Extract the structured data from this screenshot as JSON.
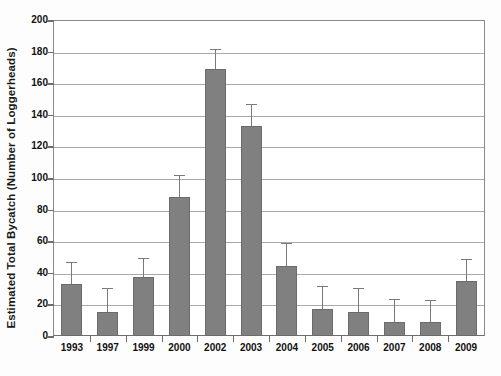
{
  "chart_data": {
    "type": "bar",
    "title": "",
    "xlabel": "",
    "ylabel": "Estimated Total Bycatch (Number of Loggerheads)",
    "ylim": [
      0,
      200
    ],
    "ytick_step": 20,
    "yticks": [
      0,
      20,
      40,
      60,
      80,
      100,
      120,
      140,
      160,
      180,
      200
    ],
    "ytick_labels": [
      "0",
      "20",
      "40",
      "60",
      "80",
      "100",
      "120",
      "140",
      "160",
      "180",
      "200"
    ],
    "grid": true,
    "grid_axis": "y",
    "legend": false,
    "legend_position": "none",
    "bar_color": "#808080",
    "bar_edge_color": "#6b6b6b",
    "error_bar_color": "#7a7a7a",
    "error_bar_style": "upper-only",
    "categories": [
      "1993",
      "1997",
      "1999",
      "2000",
      "2002",
      "2003",
      "2004",
      "2005",
      "2006",
      "2007",
      "2008",
      "2009"
    ],
    "values": [
      33,
      15.5,
      37.5,
      88,
      169,
      133,
      44,
      17,
      15,
      9,
      9,
      35
    ],
    "error_upper": [
      46,
      30,
      49,
      101,
      181,
      146,
      58,
      31,
      30,
      23,
      22,
      48
    ],
    "series": [
      {
        "name": "Estimated Total Bycatch",
        "values": [
          33,
          15.5,
          37.5,
          88,
          169,
          133,
          44,
          17,
          15,
          9,
          9,
          35
        ],
        "error_upper": [
          46,
          30,
          49,
          101,
          181,
          146,
          58,
          31,
          30,
          23,
          22,
          48
        ]
      }
    ]
  }
}
